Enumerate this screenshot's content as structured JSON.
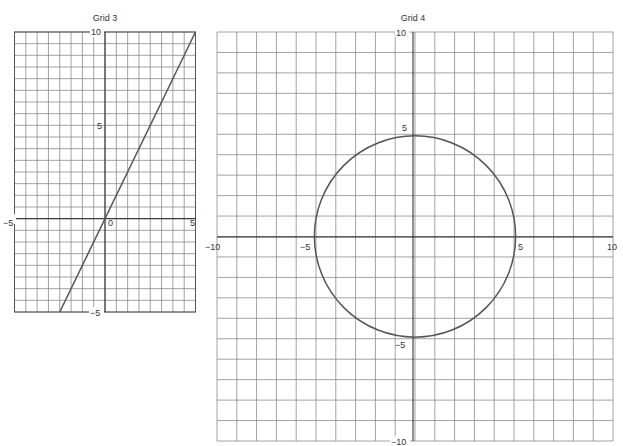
{
  "chart_data": [
    {
      "type": "line",
      "title": "Grid 3",
      "xlabel": "",
      "ylabel": "",
      "xlim": [
        -5,
        5
      ],
      "ylim": [
        -5,
        10
      ],
      "grid": true,
      "grid_step": 0.625,
      "x_ticks": [
        "-5",
        "0",
        "5"
      ],
      "y_ticks": [
        "-5",
        "5",
        "10"
      ],
      "series": [
        {
          "name": "y = 2x",
          "x": [
            -2.5,
            5
          ],
          "y": [
            -5,
            10
          ]
        }
      ]
    },
    {
      "type": "line",
      "title": "Grid 4",
      "xlabel": "",
      "ylabel": "",
      "xlim": [
        -10,
        10
      ],
      "ylim": [
        -10,
        10
      ],
      "grid": true,
      "grid_step": 1,
      "x_ticks": [
        "-10",
        "-5",
        "5",
        "10"
      ],
      "y_ticks": [
        "-10",
        "-5",
        "5",
        "10"
      ],
      "series": [
        {
          "name": "circle x^2 + y^2 = 25",
          "center": [
            0,
            0
          ],
          "radius": 5
        }
      ]
    }
  ],
  "labels": {
    "grid3_title": "Grid 3",
    "grid4_title": "Grid 4",
    "g3_x_neg5": "−5",
    "g3_x_0": "0",
    "g3_x_5": "5",
    "g3_y_10": "10",
    "g3_y_5": "5",
    "g3_y_neg5": "−5",
    "g4_x_neg10": "−10",
    "g4_x_neg5": "−5",
    "g4_x_5": "5",
    "g4_x_10": "10",
    "g4_y_10": "10",
    "g4_y_5": "5",
    "g4_y_neg5": "−5",
    "g4_y_neg10": "−10"
  }
}
